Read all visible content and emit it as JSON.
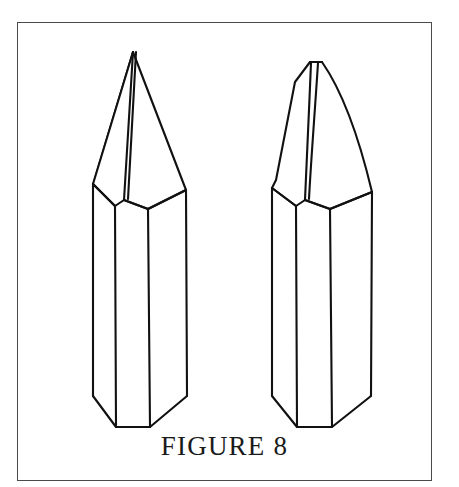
{
  "figure": {
    "caption": "FIGURE 8",
    "background_color": "#ffffff",
    "frame_color": "#4a4a4a",
    "line_color": "#111111",
    "frame": {
      "x": 17,
      "y": 22,
      "width": 415,
      "height": 459
    },
    "objects": [
      {
        "name": "left-crystal",
        "label": "Left quartz crystal with symmetric pointed termination",
        "tip_point": {
          "x": 133,
          "y": 52
        },
        "termination": "sharp-symmetric-pyramid",
        "prism_left_edge_x": 93,
        "prism_front_left_edge_x": 115,
        "prism_front_right_edge_x": 148,
        "prism_right_edge_x": 186,
        "shoulder_left": {
          "x": 97,
          "y": 178
        },
        "notch_bottom": {
          "x": 124,
          "y": 200
        },
        "shoulder_right": {
          "x": 190,
          "y": 190
        },
        "base_bottom_y": 432
      },
      {
        "name": "right-crystal",
        "label": "Right quartz crystal with curved bent termination and flat tip face",
        "tip_point": {
          "x": 316,
          "y": 62
        },
        "termination": "curved-bent-pyramid",
        "prism_left_edge_x": 272,
        "prism_front_left_edge_x": 296,
        "prism_front_right_edge_x": 330,
        "prism_right_edge_x": 368,
        "shoulder_left": {
          "x": 276,
          "y": 180
        },
        "notch_bottom": {
          "x": 305,
          "y": 200
        },
        "shoulder_right": {
          "x": 372,
          "y": 192
        },
        "base_bottom_y": 432
      }
    ]
  }
}
